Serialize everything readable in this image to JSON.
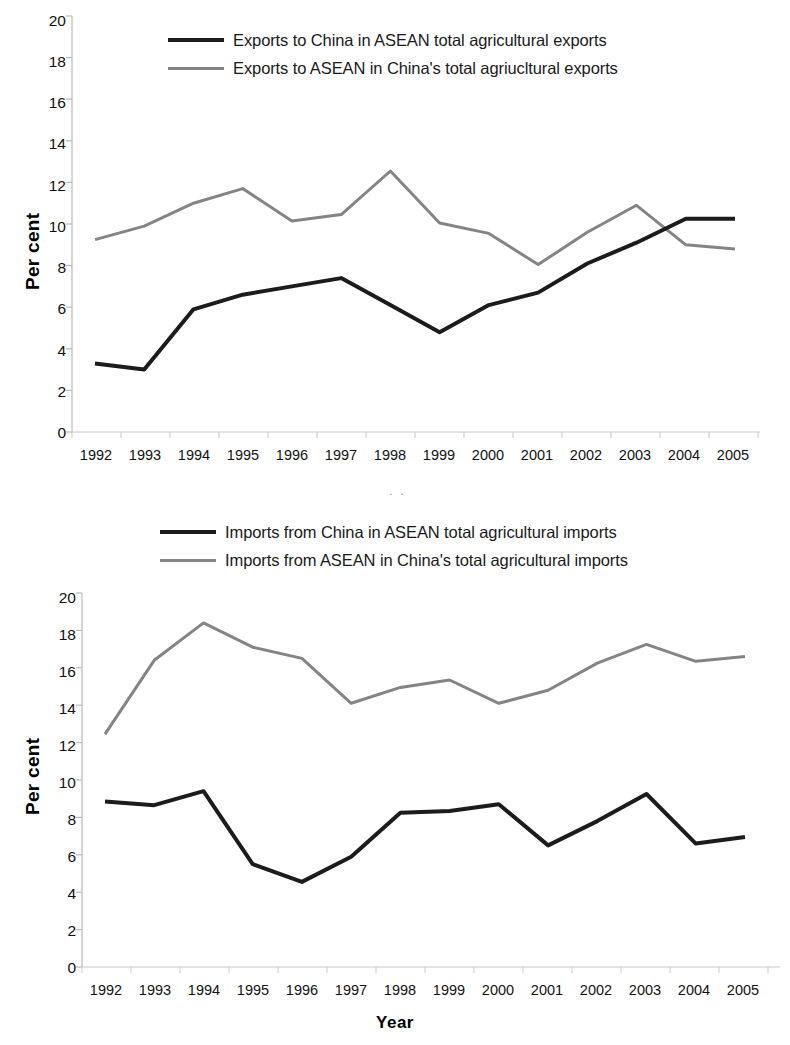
{
  "figure": {
    "panels": [
      {
        "id": "exports",
        "legend": [
          {
            "label": "Exports to China in ASEAN total agricultural exports",
            "color": "#1c1c1c",
            "style": "dark"
          },
          {
            "label": "Exports to ASEAN in China's total agriucltural exports",
            "color": "#848484",
            "style": "grey"
          }
        ],
        "ylabel": "Per cent",
        "xlabel": "",
        "artifact_text": ". ."
      },
      {
        "id": "imports",
        "legend": [
          {
            "label": "Imports from China in ASEAN total agricultural imports",
            "color": "#1c1c1c",
            "style": "dark"
          },
          {
            "label": "Imports from ASEAN in China's total agricultural imports",
            "color": "#848484",
            "style": "grey"
          }
        ],
        "ylabel": "Per cent",
        "xlabel": "Year",
        "artifact_text": ""
      }
    ]
  },
  "chart_data": [
    {
      "type": "line",
      "title": "",
      "xlabel": "",
      "ylabel": "Per cent",
      "categories": [
        "1992",
        "1993",
        "1994",
        "1995",
        "1996",
        "1997",
        "1998",
        "1999",
        "2000",
        "2001",
        "2002",
        "2003",
        "2004",
        "2005"
      ],
      "ylim": [
        0,
        20
      ],
      "yticks": [
        0,
        2,
        4,
        6,
        8,
        10,
        12,
        14,
        16,
        18,
        20
      ],
      "grid": false,
      "legend_position": "top",
      "series": [
        {
          "name": "Exports to China in ASEAN total agricultural exports",
          "color": "#1c1c1c",
          "values": [
            3.3,
            3.0,
            5.9,
            6.6,
            7.0,
            7.4,
            6.1,
            4.8,
            6.1,
            6.7,
            8.1,
            9.1,
            10.25,
            10.25
          ]
        },
        {
          "name": "Exports to ASEAN in China's total agriucltural exports",
          "color": "#848484",
          "values": [
            9.25,
            9.9,
            11.0,
            11.7,
            10.15,
            10.45,
            12.55,
            10.05,
            9.55,
            8.05,
            9.6,
            10.9,
            9.0,
            8.8
          ]
        }
      ]
    },
    {
      "type": "line",
      "title": "",
      "xlabel": "Year",
      "ylabel": "Per cent",
      "categories": [
        "1992",
        "1993",
        "1994",
        "1995",
        "1996",
        "1997",
        "1998",
        "1999",
        "2000",
        "2001",
        "2002",
        "2003",
        "2004",
        "2005"
      ],
      "ylim": [
        0,
        20
      ],
      "yticks": [
        0,
        2,
        4,
        6,
        8,
        10,
        12,
        14,
        16,
        18,
        20
      ],
      "grid": false,
      "legend_position": "top",
      "series": [
        {
          "name": "Imports from China in ASEAN total agricultural imports",
          "color": "#1c1c1c",
          "values": [
            8.85,
            8.65,
            9.4,
            5.5,
            4.55,
            5.9,
            8.25,
            8.35,
            8.7,
            6.5,
            7.8,
            9.25,
            6.6,
            6.95
          ]
        },
        {
          "name": "Imports from ASEAN in China's total agricultural imports",
          "color": "#848484",
          "values": [
            12.45,
            16.4,
            18.4,
            17.1,
            16.5,
            14.1,
            14.95,
            15.35,
            14.1,
            14.8,
            16.25,
            17.25,
            16.35,
            16.6
          ]
        }
      ]
    }
  ]
}
